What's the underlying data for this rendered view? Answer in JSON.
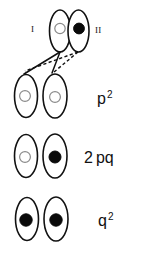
{
  "figure": {
    "colors": {
      "outline": "#111111",
      "filled_allele": "#0a0a0a",
      "open_allele_stroke": "#8a8a8a",
      "background": "#ffffff"
    },
    "gamete_row": {
      "label_left": "I",
      "label_right": "II",
      "left_allele": "open",
      "right_allele": "filled"
    },
    "genotype_rows": [
      {
        "frequency_base": "p",
        "frequency_exponent": "2",
        "frequency_coefficient": "",
        "frequency_text": "p 2",
        "left_allele": "open",
        "right_allele": "open"
      },
      {
        "frequency_base": "pq",
        "frequency_exponent": "",
        "frequency_coefficient": "2",
        "frequency_text": "2 p q",
        "left_allele": "open",
        "right_allele": "filled"
      },
      {
        "frequency_base": "q",
        "frequency_exponent": "2",
        "frequency_coefficient": "",
        "frequency_text": "q 2",
        "left_allele": "filled",
        "right_allele": "filled"
      }
    ]
  }
}
